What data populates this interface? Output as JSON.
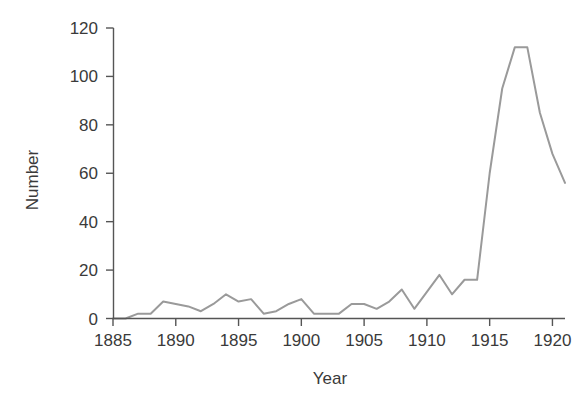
{
  "chart_data": {
    "type": "line",
    "title": "",
    "xlabel": "Year",
    "ylabel": "Number",
    "xlim": [
      1885,
      1921
    ],
    "ylim": [
      0,
      120
    ],
    "grid": false,
    "legend": null,
    "line_color": "#9a9a9a",
    "axis_color": "#555555",
    "text_color": "#3a3a3a",
    "xticks": [
      1885,
      1890,
      1895,
      1900,
      1905,
      1910,
      1915,
      1920
    ],
    "xtick_labels": [
      "1885",
      "1890",
      "1895",
      "1900",
      "1905",
      "1910",
      "1915",
      "1920"
    ],
    "yticks": [
      0,
      20,
      40,
      60,
      80,
      100,
      120
    ],
    "ytick_labels": [
      "0",
      "20",
      "40",
      "60",
      "80",
      "100",
      "120"
    ],
    "x": [
      1885,
      1886,
      1887,
      1888,
      1889,
      1890,
      1891,
      1892,
      1893,
      1894,
      1895,
      1896,
      1897,
      1898,
      1899,
      1900,
      1901,
      1902,
      1903,
      1904,
      1905,
      1906,
      1907,
      1908,
      1909,
      1910,
      1911,
      1912,
      1913,
      1914,
      1915,
      1916,
      1917,
      1918,
      1919,
      1920,
      1921
    ],
    "values": [
      0,
      0,
      2,
      2,
      7,
      6,
      5,
      3,
      6,
      10,
      7,
      8,
      2,
      3,
      6,
      8,
      2,
      2,
      2,
      6,
      6,
      4,
      7,
      12,
      4,
      11,
      18,
      10,
      16,
      16,
      60,
      95,
      112,
      112,
      85,
      68,
      56
    ]
  },
  "axes": {
    "ylabel_text": "Number",
    "xlabel_text": "Year"
  }
}
